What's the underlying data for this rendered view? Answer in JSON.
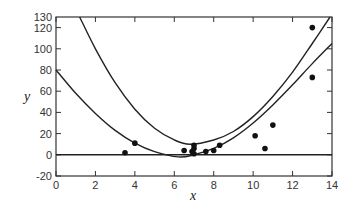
{
  "chart_data": {
    "type": "scatter",
    "title": "",
    "xlabel": "x",
    "ylabel": "y",
    "xlim": [
      0,
      14
    ],
    "ylim": [
      -20,
      130
    ],
    "xticks": [
      0,
      2,
      4,
      6,
      8,
      10,
      12,
      14
    ],
    "yticks": [
      -20,
      0,
      20,
      40,
      60,
      80,
      100,
      120,
      130
    ],
    "grid": false,
    "legend": null,
    "series": [
      {
        "name": "observations",
        "type": "scatter",
        "x": [
          3.5,
          4.0,
          6.5,
          6.9,
          7.0,
          7.0,
          7.0,
          7.6,
          8.0,
          8.3,
          10.1,
          10.6,
          11.0,
          13.0,
          13.0
        ],
        "y": [
          2,
          11,
          4,
          3,
          6,
          9,
          1,
          3,
          4,
          9,
          18,
          6,
          28,
          120,
          73
        ]
      },
      {
        "name": "upper curve",
        "type": "line",
        "x": [
          1.2,
          2,
          3,
          4,
          5,
          6,
          6.8,
          8,
          9,
          10,
          11,
          12,
          13,
          13.9
        ],
        "y": [
          130,
          100,
          68,
          43,
          25,
          14,
          10,
          14,
          22,
          36,
          55,
          78,
          105,
          130
        ]
      },
      {
        "name": "lower curve",
        "type": "line",
        "x": [
          0,
          1,
          2,
          3,
          4,
          5,
          6.2,
          7,
          8,
          9,
          10,
          11,
          12,
          13,
          14
        ],
        "y": [
          80,
          58,
          39,
          23,
          11,
          3,
          -2,
          0,
          6,
          16,
          30,
          47,
          66,
          86,
          105
        ]
      },
      {
        "name": "zero line",
        "type": "line",
        "x": [
          0,
          14
        ],
        "y": [
          0,
          0
        ]
      }
    ]
  }
}
